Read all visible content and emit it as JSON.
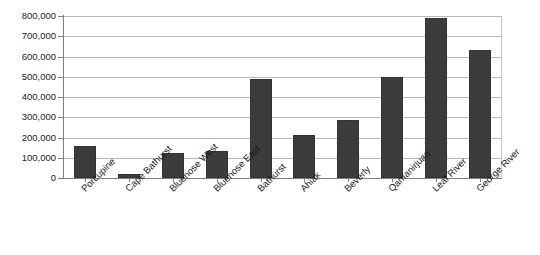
{
  "chart_data": {
    "type": "bar",
    "title": "",
    "xlabel": "",
    "ylabel": "",
    "categories": [
      "Porcupine",
      "Cape Bathurst",
      "Bluenose West",
      "Bluenose East",
      "Bathurst",
      "Ahiak",
      "Beverly",
      "Qamanirjuaq",
      "Leaf River",
      "George River"
    ],
    "values": [
      160000,
      22000,
      125000,
      135000,
      490000,
      210000,
      285000,
      500000,
      790000,
      630000
    ],
    "ylim": [
      0,
      800000
    ],
    "ytick_values": [
      0,
      100000,
      200000,
      300000,
      400000,
      500000,
      600000,
      700000,
      800000
    ],
    "ytick_labels": [
      "0",
      "100,000",
      "200,000",
      "300,000",
      "400,000",
      "500,000",
      "600,000",
      "700,000",
      "800,000"
    ],
    "grid": true,
    "legend": false,
    "bar_color": "#3c3c3c",
    "gridline_color": "#b9b9b9",
    "axis_color": "#7f7f7f",
    "background": "#ffffff"
  }
}
